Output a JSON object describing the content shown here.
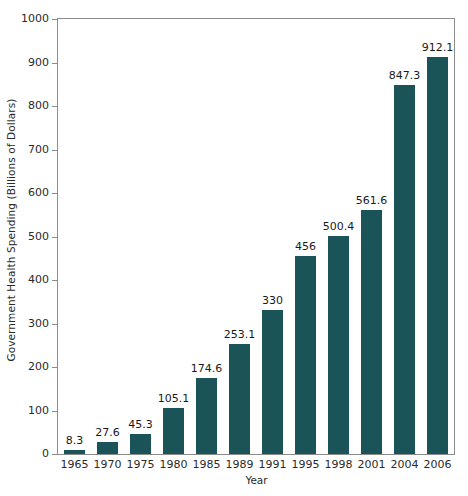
{
  "chart_data": {
    "type": "bar",
    "title": "",
    "xlabel": "Year",
    "ylabel": "Government Health Spending (Billions of Dollars)",
    "categories": [
      "1965",
      "1970",
      "1975",
      "1980",
      "1985",
      "1989",
      "1991",
      "1995",
      "1998",
      "2001",
      "2004",
      "2006"
    ],
    "values": [
      8.3,
      27.6,
      45.3,
      105.1,
      174.6,
      253.1,
      330,
      456,
      500.4,
      561.6,
      847.3,
      912.1
    ],
    "value_labels": [
      "8.3",
      "27.6",
      "45.3",
      "105.1",
      "174.6",
      "253.1",
      "330",
      "456",
      "500.4",
      "561.6",
      "847.3",
      "912.1"
    ],
    "ylim": [
      0,
      1000
    ],
    "ytick_values": [
      0,
      100,
      200,
      300,
      400,
      500,
      600,
      700,
      800,
      900,
      1000
    ],
    "ytick_labels": [
      "0",
      "100",
      "200",
      "300",
      "400",
      "500",
      "600",
      "700",
      "800",
      "900",
      "1000"
    ],
    "grid": false,
    "legend": null,
    "bar_color": "#1a5458",
    "frame_color": "#8c8c8c",
    "background": "#ffffff"
  }
}
